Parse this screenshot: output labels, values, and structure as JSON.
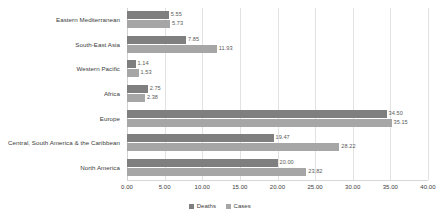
{
  "chart_data": {
    "type": "bar",
    "orientation": "horizontal",
    "title": "",
    "xlabel": "",
    "ylabel": "",
    "xlim": [
      0,
      40
    ],
    "xticks": [
      "0.00",
      "5.00",
      "10.00",
      "15.00",
      "20.00",
      "25.00",
      "30.00",
      "35.00",
      "40.00"
    ],
    "xtick_values": [
      0,
      5,
      10,
      15,
      20,
      25,
      30,
      35,
      40
    ],
    "grid": true,
    "legend_position": "bottom",
    "categories": [
      "Eastern Mediterranean",
      "South-East Asia",
      "Western Pacific",
      "Africa",
      "Europe",
      "Central, South America & the Caribbean",
      "North America"
    ],
    "series": [
      {
        "name": "Deaths",
        "color": "#7f7f7f",
        "values": [
          5.55,
          7.85,
          1.14,
          2.75,
          34.5,
          19.47,
          20.0
        ],
        "labels": [
          "5.55",
          "7.85",
          "1.14",
          "2.75",
          "34.50",
          "19.47",
          "20.00"
        ]
      },
      {
        "name": "Cases",
        "color": "#a6a6a6",
        "values": [
          5.73,
          11.93,
          1.53,
          2.38,
          35.15,
          28.22,
          23.82
        ],
        "labels": [
          "5.73",
          "11.93",
          "1.53",
          "2.38",
          "35.15",
          "28.22",
          "23.82"
        ]
      }
    ]
  }
}
